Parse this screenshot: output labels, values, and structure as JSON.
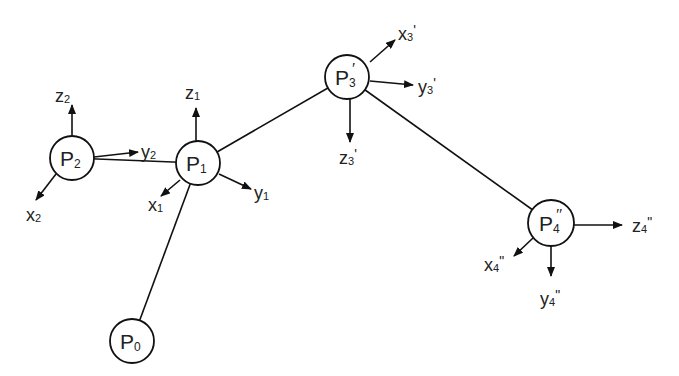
{
  "diagram": {
    "type": "kinematic-chain",
    "colors": {
      "stroke": "#111111",
      "text": "#222222",
      "background": "#ffffff"
    },
    "nodes": [
      {
        "id": "P0",
        "base": "P",
        "sub": "0",
        "prime": "",
        "x": 132,
        "y": 341,
        "r": 22
      },
      {
        "id": "P1",
        "base": "P",
        "sub": "1",
        "prime": "",
        "x": 198,
        "y": 163,
        "r": 22
      },
      {
        "id": "P2",
        "base": "P",
        "sub": "2",
        "prime": "",
        "x": 72,
        "y": 158,
        "r": 22
      },
      {
        "id": "P3'",
        "base": "P",
        "sub": "3",
        "prime": "′",
        "x": 347,
        "y": 77,
        "r": 22
      },
      {
        "id": "P4''",
        "base": "P",
        "sub": "4",
        "prime": "″",
        "x": 551,
        "y": 223,
        "r": 23
      }
    ],
    "links": [
      {
        "from": "P0",
        "to": "P1"
      },
      {
        "from": "P2",
        "to": "P1"
      },
      {
        "from": "P1",
        "to": "P3'"
      },
      {
        "from": "P3'",
        "to": "P4''"
      }
    ],
    "axes": [
      {
        "node": "P2",
        "name": "z",
        "sub": "2",
        "prime": "",
        "x1": 72,
        "y1": 136,
        "x2": 72,
        "y2": 105,
        "lx": 55,
        "ly": 102
      },
      {
        "node": "P2",
        "name": "y",
        "sub": "2",
        "prime": "",
        "x1": 94,
        "y1": 157,
        "x2": 138,
        "y2": 152,
        "lx": 141,
        "ly": 158
      },
      {
        "node": "P2",
        "name": "x",
        "sub": "2",
        "prime": "",
        "x1": 56,
        "y1": 174,
        "x2": 36,
        "y2": 200,
        "lx": 26,
        "ly": 221
      },
      {
        "node": "P1",
        "name": "z",
        "sub": "1",
        "prime": "",
        "x1": 196,
        "y1": 141,
        "x2": 196,
        "y2": 108,
        "lx": 185,
        "ly": 99
      },
      {
        "node": "P1",
        "name": "y",
        "sub": "1",
        "prime": "",
        "x1": 219,
        "y1": 174,
        "x2": 251,
        "y2": 189,
        "lx": 254,
        "ly": 199
      },
      {
        "node": "P1",
        "name": "x",
        "sub": "1",
        "prime": "",
        "x1": 180,
        "y1": 180,
        "x2": 161,
        "y2": 196,
        "lx": 148,
        "ly": 211
      },
      {
        "node": "P3'",
        "name": "x",
        "sub": "3",
        "prime": "'",
        "x1": 370,
        "y1": 62,
        "x2": 395,
        "y2": 40,
        "lx": 398,
        "ly": 40
      },
      {
        "node": "P3'",
        "name": "y",
        "sub": "3",
        "prime": "'",
        "x1": 370,
        "y1": 81,
        "x2": 413,
        "y2": 85,
        "lx": 418,
        "ly": 93
      },
      {
        "node": "P3'",
        "name": "z",
        "sub": "3",
        "prime": "'",
        "x1": 350,
        "y1": 99,
        "x2": 350,
        "y2": 142,
        "lx": 339,
        "ly": 164
      },
      {
        "node": "P4''",
        "name": "z",
        "sub": "4",
        "prime": "\"",
        "x1": 574,
        "y1": 225,
        "x2": 622,
        "y2": 225,
        "lx": 632,
        "ly": 232
      },
      {
        "node": "P4''",
        "name": "x",
        "sub": "4",
        "prime": "\"",
        "x1": 533,
        "y1": 238,
        "x2": 514,
        "y2": 256,
        "lx": 484,
        "ly": 271
      },
      {
        "node": "P4''",
        "name": "y",
        "sub": "4",
        "prime": "\"",
        "x1": 551,
        "y1": 246,
        "x2": 551,
        "y2": 276,
        "lx": 540,
        "ly": 305
      }
    ]
  }
}
